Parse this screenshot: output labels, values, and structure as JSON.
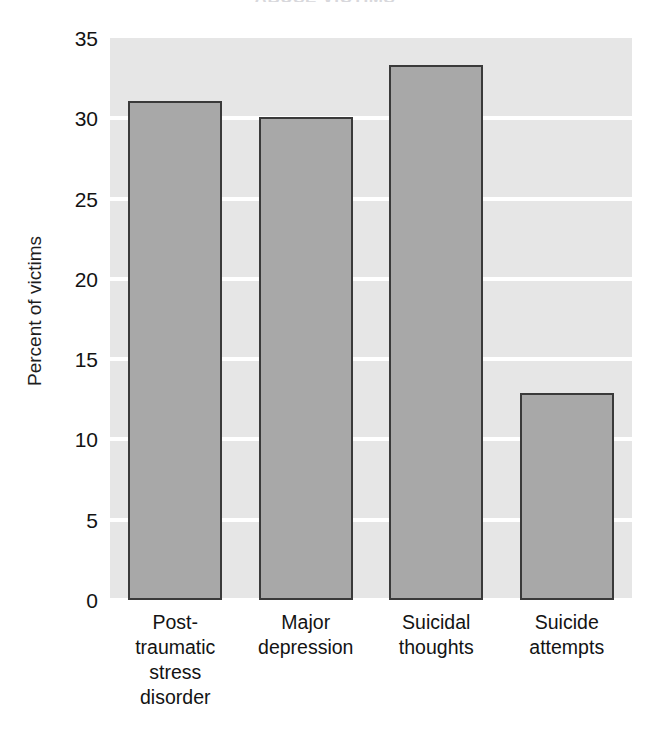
{
  "chart_data": {
    "type": "bar",
    "title": "ABUSE VICTIMS",
    "xlabel": "",
    "ylabel": "Percent of victims",
    "categories": [
      "Post-traumatic stress disorder",
      "Major depression",
      "Suicidal thoughts",
      "Suicide attempts"
    ],
    "category_lines": [
      [
        "Post-",
        "traumatic",
        "stress",
        "disorder"
      ],
      [
        "Major",
        "depression"
      ],
      [
        "Suicidal",
        "thoughts"
      ],
      [
        "Suicide",
        "attempts"
      ]
    ],
    "values": [
      31.1,
      30.1,
      33.3,
      12.9
    ],
    "ylim": [
      0,
      35
    ],
    "ytick_labels": [
      "0",
      "5",
      "10",
      "15",
      "20",
      "25",
      "30",
      "35"
    ],
    "ytick_values": [
      0,
      5,
      10,
      15,
      20,
      25,
      30,
      35
    ],
    "grid": true,
    "legend": "none",
    "colors": {
      "bar_fill": "#a8a8a8",
      "bar_edge": "#3a3a3a",
      "plot_background": "#e6e6e6",
      "gridline": "#ffffff",
      "text": "#131313",
      "figure_background": "#ffffff"
    }
  }
}
